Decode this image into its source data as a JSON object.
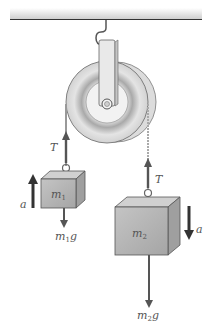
{
  "diagram": {
    "colors": {
      "ceiling": "#d9d9d9",
      "ceiling_line": "#333333",
      "pulley": "#e6e6e6",
      "pulley_groove": "#bcbcbc",
      "block": "#b8b8b8",
      "arrow": "#555555",
      "label": "#555555"
    },
    "labels": {
      "tension_left": "T",
      "tension_right": "T",
      "accel_left": "a",
      "accel_right": "a",
      "mass1": {
        "base": "m",
        "sub": "1"
      },
      "mass2": {
        "base": "m",
        "sub": "2"
      },
      "weight1": {
        "base": "m",
        "sub": "1",
        "suffix": "g"
      },
      "weight2": {
        "base": "m",
        "sub": "2",
        "suffix": "g"
      }
    }
  }
}
